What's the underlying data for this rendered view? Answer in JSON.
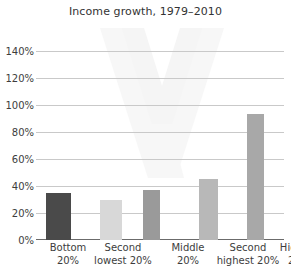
{
  "chart_data": {
    "type": "bar",
    "title": "Income growth, 1979–2010",
    "xlabel": "",
    "ylabel": "",
    "categories": [
      "Bottom 20%",
      "Second lowest 20%",
      "Middle 20%",
      "Second highest 20%",
      "Highest 20%"
    ],
    "category_lines": [
      [
        "Bottom",
        "20%"
      ],
      [
        "Second",
        "lowest 20%"
      ],
      [
        "Middle",
        "20%"
      ],
      [
        "Second",
        "highest 20%"
      ],
      [
        "Highest",
        "20%"
      ]
    ],
    "values": [
      35,
      30,
      37,
      45,
      93
    ],
    "value_labels": [
      "35%",
      "30%",
      "37%",
      "45%",
      "93%"
    ],
    "ylim": [
      0,
      140
    ],
    "ytick_values": [
      0,
      20,
      40,
      60,
      80,
      100,
      120,
      140
    ],
    "ytick_labels": [
      "0%",
      "20%",
      "40%",
      "60%",
      "80%",
      "100%",
      "120%",
      "140%"
    ],
    "grid": true,
    "legend": false,
    "bar_colors": [
      "#4a4a4a",
      "#d8d8d8",
      "#9a9a9a",
      "#b8b8b8",
      "#a8a8a8"
    ],
    "colors": {
      "background": "#ffffff",
      "gridline": "#c9c9c9",
      "axis": "#6b6b6b",
      "title_text": "#333333",
      "tick_text": "#3d3d3d",
      "watermark": "#f0f0f0"
    }
  }
}
